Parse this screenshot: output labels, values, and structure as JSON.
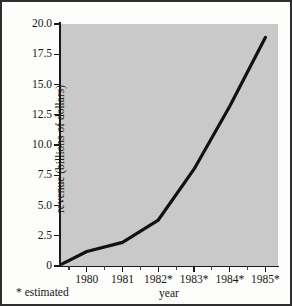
{
  "figure": {
    "background_color": "#fdfdfb",
    "border_color": "#2e2e2e",
    "plot_background_color": "#c9c9c9",
    "line_color": "#111111"
  },
  "footnote": "* estimated",
  "chart_data": {
    "type": "line",
    "title": "",
    "xlabel": "year",
    "ylabel": "revenue (billions of dollars)",
    "xlim": [
      1979.25,
      1985.35
    ],
    "ylim": [
      0,
      20
    ],
    "grid": false,
    "legend": null,
    "x_tick_labels": [
      "1980",
      "1981",
      "1982*",
      "1983*",
      "1984*",
      "1985*"
    ],
    "x_tick_values": [
      1980,
      1981,
      1982,
      1983,
      1984,
      1985
    ],
    "x_minor_ticks": [
      1979.5,
      1980.5,
      1981.5,
      1982.5,
      1983.5,
      1984.5
    ],
    "y_tick_labels": [
      "0",
      "2.5",
      "5.0",
      "7.5",
      "10.0",
      "12.5",
      "15.0",
      "17.5",
      "20.0"
    ],
    "y_tick_values": [
      0,
      2.5,
      5,
      7.5,
      10,
      12.5,
      15,
      17.5,
      20
    ],
    "series": [
      {
        "name": "revenue",
        "x": [
          1979.3,
          1980,
          1981,
          1982,
          1983,
          1984,
          1985
        ],
        "values": [
          0.15,
          1.2,
          1.95,
          3.8,
          8.0,
          13.2,
          18.9
        ]
      }
    ],
    "annotations": [
      "* estimated"
    ]
  }
}
